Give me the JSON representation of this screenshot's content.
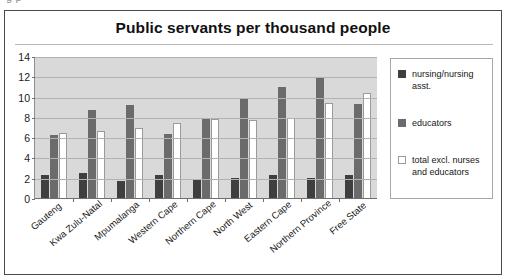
{
  "clipped_text": "g                         p",
  "figure": {
    "title": "Public servants per thousand people"
  },
  "legend": {
    "items": [
      {
        "label": "nursing/nursing asst.",
        "icon": "square-swatch-dark",
        "color": "#3f3f3f"
      },
      {
        "label": "educators",
        "icon": "square-swatch-gray",
        "color": "#6b6b6b"
      },
      {
        "label": "total excl. nurses and educators",
        "icon": "square-swatch-white",
        "color": "#ffffff"
      }
    ]
  },
  "chart_data": {
    "type": "bar",
    "title": "Public servants per thousand people",
    "xlabel": "",
    "ylabel": "",
    "ylim": [
      0,
      14
    ],
    "yticks": [
      0,
      2,
      4,
      6,
      8,
      10,
      12,
      14
    ],
    "grid": true,
    "legend_position": "right",
    "plot_background": "#d9d9d9",
    "categories": [
      "Gauteng",
      "Kwa Zulu-Natal",
      "Mpumalanga",
      "Western Cape",
      "Northern Cape",
      "North West",
      "Eastern Cape",
      "Northern Province",
      "Free State"
    ],
    "series": [
      {
        "name": "nursing/nursing asst.",
        "color": "#3f3f3f",
        "values": [
          2.4,
          2.6,
          1.8,
          2.4,
          1.9,
          2.1,
          2.4,
          2.1,
          2.4
        ]
      },
      {
        "name": "educators",
        "color": "#6b6b6b",
        "values": [
          6.3,
          8.8,
          9.3,
          6.4,
          7.9,
          10.0,
          11.0,
          12.0,
          9.4
        ]
      },
      {
        "name": "total excl. nurses and educators",
        "color": "#ffffff",
        "values": [
          6.5,
          6.7,
          7.0,
          7.5,
          7.9,
          7.8,
          8.0,
          9.5,
          10.5
        ]
      }
    ]
  }
}
